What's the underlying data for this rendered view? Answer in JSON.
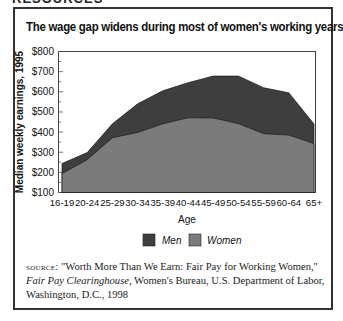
{
  "header": {
    "partial_text": "RESOURCES"
  },
  "chart_data": {
    "type": "area",
    "title": "The wage gap widens during most of women's working years",
    "xlabel": "Age",
    "ylabel": "Median weekly earnings, 1995",
    "ylim": [
      100,
      800
    ],
    "yticks": [
      "$100",
      "$200",
      "$300",
      "$400",
      "$500",
      "$600",
      "$700",
      "$800"
    ],
    "categories": [
      "16-19",
      "20-24",
      "25-29",
      "30-34",
      "35-39",
      "40-44",
      "45-49",
      "50-54",
      "55-59",
      "60-64",
      "65+"
    ],
    "series": [
      {
        "name": "Men",
        "color": "#3e3e3e",
        "values": [
          244,
          298,
          441,
          540,
          605,
          645,
          678,
          678,
          620,
          595,
          440
        ]
      },
      {
        "name": "Women",
        "color": "#7b7b7b",
        "values": [
          194,
          263,
          372,
          398,
          441,
          471,
          470,
          442,
          392,
          385,
          343
        ]
      }
    ],
    "legend": {
      "position": "bottom",
      "entries": [
        "Men",
        "Women"
      ]
    },
    "grid": false,
    "stacked": false
  },
  "source": {
    "label": "source:",
    "line1": "\"Worth More Than We Earn: Fair Pay for Working Women,\"",
    "publication": "Fair Pay Clearinghouse",
    "line2_rest": ", Women's Bureau, U.S. Department of Labor,",
    "line3": "Washington, D.C., 1998"
  }
}
